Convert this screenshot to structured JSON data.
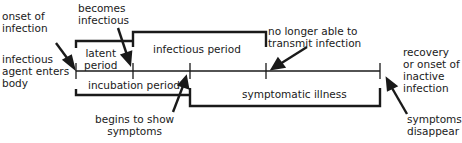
{
  "diagram": {
    "annotations": {
      "onset_of_infection": "onset of\ninfection",
      "agent_enters": "infectious\nagent enters\nbody",
      "becomes_infectious": "becomes\ninfectious",
      "no_longer_transmit": "no longer able to\ntransmit infection",
      "recovery": "recovery\nor onset of\ninactive\ninfection",
      "begins_symptoms": "begins to show\nsymptoms",
      "symptoms_disappear": "symptoms\ndisappear"
    },
    "periods": {
      "latent": "latent\nperiod",
      "infectious": "infectious period",
      "incubation": "incubation period",
      "symptomatic": "symptomatic illness"
    },
    "colors": {
      "line": "#1a1a1a",
      "background": "#ffffff"
    }
  }
}
